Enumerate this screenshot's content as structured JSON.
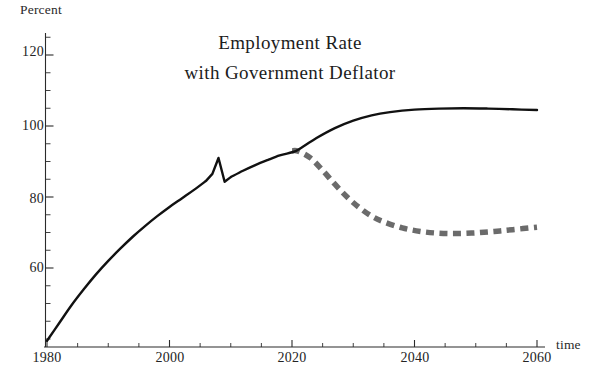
{
  "chart_data": {
    "type": "line",
    "title": "Employment Rate with Government Deflator",
    "title_line1": "Employment Rate",
    "title_line2": "with Government Deflator",
    "xlabel": "time",
    "ylabel": "Percent",
    "xlim": [
      1980,
      2060
    ],
    "ylim": [
      38,
      125
    ],
    "grid": false,
    "legend": "none",
    "x_major_ticks": [
      1980,
      2000,
      2020,
      2040,
      2060
    ],
    "x_major_tick_labels": [
      "1980",
      "2000",
      "2020",
      "2040",
      "2060"
    ],
    "x_minor_tick_step": 5,
    "y_major_ticks": [
      60,
      80,
      100,
      120
    ],
    "y_major_tick_labels": [
      "60",
      "80",
      "100",
      "120"
    ],
    "y_minor_tick_step": 5,
    "series": [
      {
        "name": "Employment rate (baseline, solid black)",
        "style": "solid",
        "color": "#111111",
        "width": 2.4,
        "x": [
          1980,
          1982,
          1984,
          1986,
          1988,
          1990,
          1992,
          1994,
          1996,
          1998,
          2000,
          2002,
          2004,
          2006,
          2007,
          2008,
          2009,
          2010,
          2012,
          2014,
          2016,
          2018,
          2020,
          2021,
          2024,
          2027,
          2030,
          2033,
          2036,
          2040,
          2044,
          2048,
          2052,
          2056,
          2060
        ],
        "y": [
          39.5,
          44.5,
          49.5,
          54.0,
          58.2,
          62.0,
          65.5,
          68.8,
          71.8,
          74.6,
          77.2,
          79.6,
          82.0,
          84.6,
          86.5,
          91.0,
          84.3,
          85.6,
          87.4,
          89.0,
          90.4,
          91.7,
          92.6,
          93.3,
          96.6,
          99.4,
          101.5,
          103.0,
          103.9,
          104.6,
          104.9,
          105.0,
          104.9,
          104.7,
          104.5
        ]
      },
      {
        "name": "Employment rate (alternative scenario, dashed gray)",
        "style": "dashed",
        "color": "#6b6b6b",
        "width": 5.5,
        "x": [
          2020,
          2021,
          2023,
          2025,
          2027,
          2029,
          2031,
          2033,
          2035,
          2038,
          2041,
          2044,
          2047,
          2050,
          2053,
          2056,
          2060
        ],
        "y": [
          93.0,
          92.9,
          91.0,
          87.5,
          83.6,
          80.0,
          77.0,
          74.6,
          73.0,
          71.3,
          70.3,
          69.8,
          69.7,
          69.9,
          70.3,
          70.8,
          71.5
        ]
      }
    ],
    "annotations": [
      {
        "text": "peak before downturn",
        "x": 2008,
        "y": 91.0
      },
      {
        "text": "downturn trough",
        "x": 2009,
        "y": 84.3
      },
      {
        "text": "scenario branch point",
        "x": 2020,
        "y": 93.0
      }
    ]
  },
  "axes": {
    "ylabel": "Percent",
    "xlabel": "time"
  },
  "title": {
    "line1": "Employment Rate",
    "line2": "with Government Deflator"
  },
  "yticks": [
    {
      "label": "120"
    },
    {
      "label": "100"
    },
    {
      "label": "80"
    },
    {
      "label": "60"
    }
  ],
  "xticks": [
    {
      "label": "1980"
    },
    {
      "label": "2000"
    },
    {
      "label": "2020"
    },
    {
      "label": "2040"
    },
    {
      "label": "2060"
    }
  ]
}
